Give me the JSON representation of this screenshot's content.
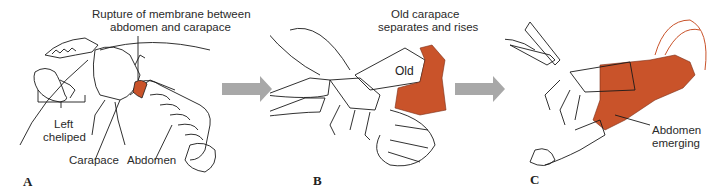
{
  "figure": {
    "colors": {
      "new_cuticle": "#c9532a",
      "arrow": "#a8a8a8",
      "line": "#1a1a1a",
      "label_text": "#2a2a2a"
    },
    "panels": [
      {
        "id": "A",
        "letter": "A",
        "labels": {
          "rupture": [
            "Rupture of membrane between",
            "abdomen and carapace"
          ],
          "cheliped": [
            "Left",
            "cheliped"
          ],
          "carapace": "Carapace",
          "abdomen": "Abdomen"
        }
      },
      {
        "id": "B",
        "letter": "B",
        "labels": {
          "old_carapace": [
            "Old carapace",
            "separates and rises"
          ],
          "old": "Old",
          "new": "New"
        }
      },
      {
        "id": "C",
        "letter": "C",
        "labels": {
          "abdomen_emerging": [
            "Abdomen",
            "emerging"
          ]
        }
      }
    ],
    "arrows": [
      {
        "from": "A",
        "to": "B",
        "icon": "right-arrow-icon"
      },
      {
        "from": "B",
        "to": "C",
        "icon": "right-arrow-icon"
      }
    ]
  }
}
